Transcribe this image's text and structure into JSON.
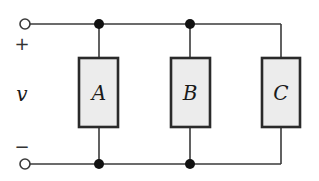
{
  "diagram": {
    "type": "circuit",
    "terminals": {
      "plus_sign": "+",
      "minus_sign": "−",
      "voltage_label": "v"
    },
    "elements": [
      {
        "id": "A",
        "label": "A"
      },
      {
        "id": "B",
        "label": "B"
      },
      {
        "id": "C",
        "label": "C"
      }
    ],
    "colors": {
      "wire": "#3a3a3a",
      "element_fill": "#ececec",
      "element_stroke": "#2a2a2a",
      "node": "#111111"
    }
  }
}
